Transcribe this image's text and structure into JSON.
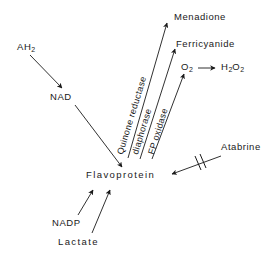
{
  "diagram": {
    "background_color": "#ffffff",
    "stroke_color": "#1a1a1a",
    "text_color": "#1a1a1a",
    "nodes": {
      "ah2": "AH",
      "ah2_sub": "2",
      "nad": "NAD",
      "flavoprotein": "Flavoprotein",
      "nadp": "NADP",
      "lactate": "Lactate",
      "menadione": "Menadione",
      "ferricyanide": "Ferricyanide",
      "o2": "O",
      "o2_sub": "2",
      "h2o2_h": "H",
      "h2o2_sub1": "2",
      "h2o2_o": "O",
      "h2o2_sub2": "2",
      "atabrine": "Atabrine"
    },
    "enzymes": {
      "quinone_reductase": "Quinone reductase",
      "diaphorase": "diaphorase",
      "fp_oxidase": "FP oxidase"
    },
    "marks": {
      "inhibition": "inhibition-double-slash"
    }
  }
}
